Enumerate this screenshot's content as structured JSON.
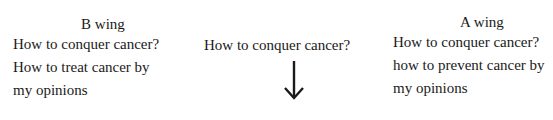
{
  "left_block": {
    "title": "B wing",
    "lines": [
      "How to conquer cancer?",
      "How to treat cancer by",
      "my opinions"
    ]
  },
  "center_block": {
    "text": "How to conquer cancer?",
    "arrow": "down-arrow-icon"
  },
  "right_block": {
    "title": "A wing",
    "lines": [
      "How to conquer cancer?",
      "how to prevent cancer by",
      "my opinions"
    ]
  }
}
